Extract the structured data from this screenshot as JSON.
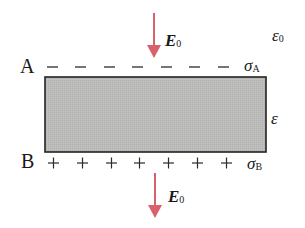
{
  "diagram": {
    "type": "dielectric-slab-in-field",
    "colors": {
      "arrow": "#d9616b",
      "slab_fill": "#b9b9b7",
      "slab_border": "#222222",
      "text": "#1a1a1a"
    },
    "labels": {
      "field_top": "E",
      "field_top_sub": "0",
      "field_bottom": "E",
      "field_bottom_sub": "0",
      "outer_permittivity": "ε",
      "outer_permittivity_sub": "0",
      "inner_permittivity": "ε",
      "surface_A": "A",
      "surface_B": "B",
      "sigma_A": "σ",
      "sigma_A_sub": "A",
      "sigma_B": "σ",
      "sigma_B_sub": "B"
    },
    "charges": {
      "top_surface_sign": "−",
      "top_count": 7,
      "bottom_surface_sign": "+",
      "bottom_count": 7
    }
  }
}
